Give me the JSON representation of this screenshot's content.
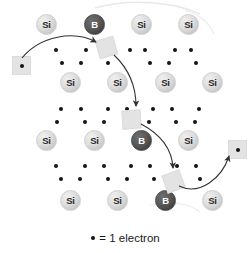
{
  "figure": {
    "background_color": "#ffffff",
    "width": 251,
    "height": 253
  },
  "legend": {
    "dot_symbol": "•",
    "text": "= 1 electron"
  },
  "colors": {
    "silicon_fill": "#dcdcdc",
    "silicon_label": "#2a2a2a",
    "boron_fill": "#4a4a4a",
    "boron_label": "#ffffff",
    "electron": "#141414",
    "hole_fill": "#e3e3e3",
    "arrow": "#333333"
  },
  "atoms": [
    {
      "label": "Si",
      "kind": "si",
      "x": 36,
      "y": 14,
      "row": 1,
      "col": 1
    },
    {
      "label": "B",
      "kind": "b",
      "x": 84,
      "y": 14,
      "row": 1,
      "col": 2
    },
    {
      "label": "Si",
      "kind": "si",
      "x": 131,
      "y": 14,
      "row": 1,
      "col": 3
    },
    {
      "label": "Si",
      "kind": "si",
      "x": 178,
      "y": 14,
      "row": 1,
      "col": 4
    },
    {
      "label": "Si",
      "kind": "si",
      "x": 60,
      "y": 72,
      "row": 2,
      "col": 1
    },
    {
      "label": "Si",
      "kind": "si",
      "x": 107,
      "y": 72,
      "row": 2,
      "col": 2
    },
    {
      "label": "Si",
      "kind": "si",
      "x": 155,
      "y": 72,
      "row": 2,
      "col": 3
    },
    {
      "label": "Si",
      "kind": "si",
      "x": 202,
      "y": 72,
      "row": 2,
      "col": 4
    },
    {
      "label": "Si",
      "kind": "si",
      "x": 36,
      "y": 130,
      "row": 3,
      "col": 1
    },
    {
      "label": "Si",
      "kind": "si",
      "x": 84,
      "y": 130,
      "row": 3,
      "col": 2
    },
    {
      "label": "B",
      "kind": "b",
      "x": 131,
      "y": 130,
      "row": 3,
      "col": 3
    },
    {
      "label": "Si",
      "kind": "si",
      "x": 178,
      "y": 130,
      "row": 3,
      "col": 4
    },
    {
      "label": "Si",
      "kind": "si",
      "x": 60,
      "y": 190,
      "row": 4,
      "col": 1
    },
    {
      "label": "Si",
      "kind": "si",
      "x": 107,
      "y": 190,
      "row": 4,
      "col": 2
    },
    {
      "label": "B",
      "kind": "b",
      "x": 155,
      "y": 190,
      "row": 4,
      "col": 3
    },
    {
      "label": "Si",
      "kind": "si",
      "x": 202,
      "y": 190,
      "row": 4,
      "col": 4
    }
  ],
  "electrons": [
    {
      "x": 54,
      "y": 48
    },
    {
      "x": 84,
      "y": 48
    },
    {
      "x": 128,
      "y": 48
    },
    {
      "x": 143,
      "y": 48
    },
    {
      "x": 173,
      "y": 48
    },
    {
      "x": 189,
      "y": 48
    },
    {
      "x": 60,
      "y": 61
    },
    {
      "x": 79,
      "y": 61
    },
    {
      "x": 106,
      "y": 61
    },
    {
      "x": 148,
      "y": 61
    },
    {
      "x": 167,
      "y": 61
    },
    {
      "x": 194,
      "y": 61
    },
    {
      "x": 59,
      "y": 107
    },
    {
      "x": 79,
      "y": 107
    },
    {
      "x": 106,
      "y": 107
    },
    {
      "x": 125,
      "y": 107
    },
    {
      "x": 151,
      "y": 107
    },
    {
      "x": 170,
      "y": 107
    },
    {
      "x": 197,
      "y": 107
    },
    {
      "x": 55,
      "y": 120
    },
    {
      "x": 83,
      "y": 120
    },
    {
      "x": 102,
      "y": 120
    },
    {
      "x": 147,
      "y": 120
    },
    {
      "x": 174,
      "y": 120
    },
    {
      "x": 193,
      "y": 120
    },
    {
      "x": 54,
      "y": 164
    },
    {
      "x": 83,
      "y": 164
    },
    {
      "x": 102,
      "y": 164
    },
    {
      "x": 129,
      "y": 164
    },
    {
      "x": 148,
      "y": 164
    },
    {
      "x": 175,
      "y": 164
    },
    {
      "x": 194,
      "y": 164
    },
    {
      "x": 59,
      "y": 177
    },
    {
      "x": 78,
      "y": 177
    },
    {
      "x": 106,
      "y": 177
    },
    {
      "x": 125,
      "y": 177
    },
    {
      "x": 152,
      "y": 177
    },
    {
      "x": 198,
      "y": 177
    }
  ],
  "holes": [
    {
      "name": "hole-free-left",
      "x": 12,
      "y": 56,
      "rot": "r0",
      "has_electron": true
    },
    {
      "name": "hole-boron-top",
      "x": 97,
      "y": 38,
      "rot": "r1",
      "has_electron": false
    },
    {
      "name": "hole-middle",
      "x": 122,
      "y": 110,
      "rot": "r2",
      "has_electron": false
    },
    {
      "name": "hole-lower",
      "x": 164,
      "y": 172,
      "rot": "r3",
      "has_electron": false
    },
    {
      "name": "hole-free-right",
      "x": 228,
      "y": 140,
      "rot": "r0",
      "has_electron": true
    }
  ],
  "arrows": [
    {
      "name": "arrow-electron-to-top-boron",
      "path": "M 22 58 C 40 36 74 30 96 42"
    },
    {
      "name": "arrow-top-to-middle-hole",
      "path": "M 114 55 C 132 72 136 92 136 106"
    },
    {
      "name": "arrow-middle-to-lower-hole",
      "path": "M 141 124 C 160 134 172 148 173 168"
    },
    {
      "name": "arrow-lower-to-free-right",
      "path": "M 179 186 C 200 196 222 178 229 156"
    }
  ]
}
